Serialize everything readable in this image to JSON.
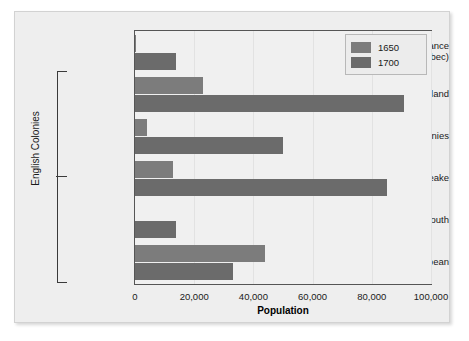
{
  "chart_data": {
    "type": "bar",
    "orientation": "horizontal",
    "title": "",
    "xlabel": "Population",
    "ylabel": "",
    "xlim": [
      0,
      100000
    ],
    "xticks": [
      0,
      20000,
      40000,
      60000,
      80000,
      100000
    ],
    "xtick_labels": [
      "0",
      "20,000",
      "40,000",
      "60,000",
      "80,000",
      "100,000"
    ],
    "grid": true,
    "legend_position": "top-right",
    "categories": [
      "New France\n(Quebec)",
      "New England",
      "Middle Colonies",
      "Chesapeake",
      "Lower South",
      "Caribbean"
    ],
    "series": [
      {
        "name": "1650",
        "color": "#7c7c7c",
        "values": [
          500,
          23000,
          4000,
          13000,
          0,
          44000
        ]
      },
      {
        "name": "1700",
        "color": "#6b6b6b",
        "values": [
          14000,
          91000,
          50000,
          85000,
          14000,
          33000
        ]
      }
    ],
    "annotations": [
      {
        "text": "English Colonies",
        "type": "group-bracket",
        "covers": [
          "New England",
          "Middle Colonies",
          "Chesapeake",
          "Lower South",
          "Caribbean"
        ]
      }
    ]
  },
  "categories_display": [
    {
      "line1": "New France",
      "line2": "(Quebec)"
    },
    {
      "line1": "New England",
      "line2": ""
    },
    {
      "line1": "Middle Colonies",
      "line2": ""
    },
    {
      "line1": "Chesapeake",
      "line2": ""
    },
    {
      "line1": "Lower South",
      "line2": ""
    },
    {
      "line1": "Caribbean",
      "line2": ""
    }
  ],
  "legend": {
    "items": [
      {
        "label": "1650",
        "color": "#7c7c7c"
      },
      {
        "label": "1700",
        "color": "#6b6b6b"
      }
    ]
  },
  "group_label": "English Colonies"
}
